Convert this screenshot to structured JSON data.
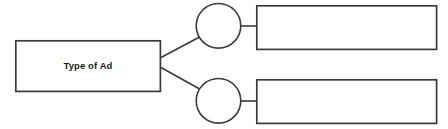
{
  "diagram": {
    "type": "tree-branch-diagram",
    "background_color": "#ffffff",
    "stroke_color": "#3a3a3a",
    "fill_color": "#ffffff",
    "root": {
      "label": "Type of Ad",
      "shape": "rectangle",
      "x": 15,
      "y": 40,
      "width": 146,
      "height": 52
    },
    "circles": [
      {
        "label": "",
        "shape": "circle",
        "cx": 218.5,
        "cy": 25.5,
        "r": 22.5
      },
      {
        "label": "",
        "shape": "circle",
        "cx": 218.5,
        "cy": 100.5,
        "r": 22.5
      }
    ],
    "branch_boxes": [
      {
        "label": "",
        "shape": "rectangle",
        "x": 256,
        "y": 5,
        "width": 181,
        "height": 45
      },
      {
        "label": "",
        "shape": "rectangle",
        "x": 256,
        "y": 79,
        "width": 181,
        "height": 45
      }
    ],
    "connectors": [
      {
        "from": "root",
        "to": "circle-1",
        "style": "diagonal-line"
      },
      {
        "from": "root",
        "to": "circle-2",
        "style": "diagonal-line"
      },
      {
        "from": "circle-1",
        "to": "branch-box-1",
        "style": "horizontal-line"
      },
      {
        "from": "circle-2",
        "to": "branch-box-2",
        "style": "horizontal-line"
      }
    ]
  }
}
